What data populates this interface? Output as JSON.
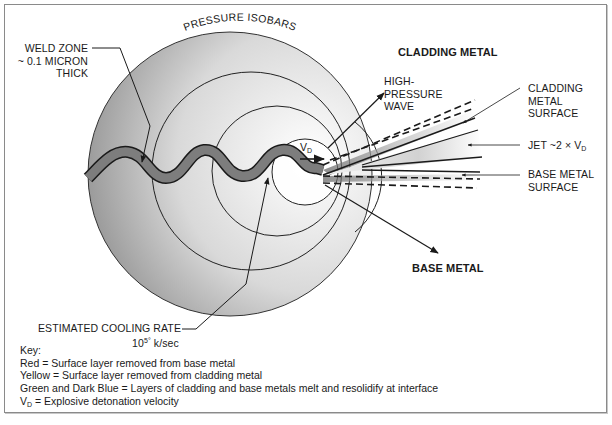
{
  "diagram": {
    "title_arc_label": "PRESSURE ISOBARS",
    "labels": {
      "weld_zone": [
        "WELD ZONE",
        "~ 0.1 MICRON",
        "THICK"
      ],
      "cladding_metal": "CLADDING METAL",
      "high_pressure_wave": [
        "HIGH-",
        "PRESSURE",
        "WAVE"
      ],
      "cladding_metal_surface": [
        "CLADDING",
        "METAL",
        "SURFACE"
      ],
      "jet": {
        "text": "JET ~2 × V",
        "subscript": "D"
      },
      "base_metal_surface": [
        "BASE METAL",
        "SURFACE"
      ],
      "base_metal": "BASE METAL",
      "detonation_velocity": {
        "text": "V",
        "subscript": "D"
      },
      "cooling_rate": {
        "line1": "ESTIMATED COOLING RATE",
        "line2_base": "10",
        "line2_sup": "5°",
        "line2_unit": " k/sec"
      }
    },
    "key": {
      "heading": "Key:",
      "items": [
        "Red = Surface layer removed from base metal",
        "Yellow = Surface layer removed from cladding metal",
        "Green and Dark Blue = Layers of cladding and base metals melt and resolidify at interface"
      ],
      "vd_item": {
        "symbol": "V",
        "subscript": "D",
        "text": " = Explosive detonation velocity"
      }
    },
    "isobars": [
      {
        "cx": 230,
        "cy": 174,
        "r": 142
      },
      {
        "cx": 251,
        "cy": 171,
        "r": 99
      },
      {
        "cx": 277,
        "cy": 171,
        "r": 65
      },
      {
        "cx": 305,
        "cy": 172,
        "r": 33
      }
    ],
    "colors": {
      "frame": "#8a8a8a",
      "isobar_outer": "#9a9a9a",
      "isobar_inner": "#f6f6f6",
      "weld_band": "#7d7d7d",
      "line": "#1a1a1a"
    }
  }
}
